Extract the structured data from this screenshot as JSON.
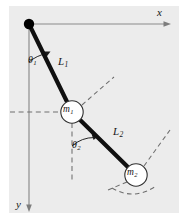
{
  "figure": {
    "kind": "double-pendulum-schematic",
    "background_color": "#ececec",
    "margin_color": "#ffffff",
    "axis_color": "#8a8a8a",
    "rod_color": "#101010",
    "dash_color": "#707070",
    "mass_fill": "#ffffff",
    "mass_stroke": "#303030",
    "pivot_color": "#000000"
  },
  "axes": {
    "x_label": "x",
    "y_label": "y",
    "x_origin": [
      29,
      24
    ],
    "x_end": [
      170,
      24
    ],
    "y_end": [
      29,
      212
    ]
  },
  "pivot": {
    "x": 29,
    "y": 24,
    "radius": 5.2
  },
  "rods": [
    {
      "name": "upper-rod",
      "label": "L",
      "subscript": "1",
      "from": [
        29,
        24
      ],
      "to": [
        72,
        112
      ],
      "width": 4.2
    },
    {
      "name": "lower-rod",
      "label": "L",
      "subscript": "2",
      "from": [
        72,
        112
      ],
      "to": [
        136,
        175
      ],
      "width": 4.2
    }
  ],
  "masses": [
    {
      "name": "mass-one",
      "label": "m",
      "subscript": "1",
      "cx": 72,
      "cy": 112,
      "r": 11.2
    },
    {
      "name": "mass-two",
      "label": "m",
      "subscript": "2",
      "cx": 136,
      "cy": 175,
      "r": 11.2
    }
  ],
  "angles": [
    {
      "name": "theta-one",
      "label": "θ",
      "subscript": "1",
      "vertex": [
        29,
        24
      ],
      "measured_from": "downward-vertical",
      "toward": "upper-rod"
    },
    {
      "name": "theta-two",
      "label": "θ",
      "subscript": "2",
      "vertex": [
        72,
        112
      ],
      "measured_from": "downward-vertical",
      "toward": "lower-rod"
    }
  ],
  "reference_lines": [
    {
      "name": "horizontal-dashed-through-m1",
      "orientation": "horizontal",
      "y": 112
    },
    {
      "name": "vertical-dashed-below-m1",
      "orientation": "vertical",
      "x": 72
    },
    {
      "name": "dashed-ray-upper-right-of-m1",
      "orientation": "diagonal"
    },
    {
      "name": "dashed-ray-upper-right-of-m2",
      "orientation": "diagonal"
    },
    {
      "name": "dashed-arc-below-m2",
      "orientation": "arc"
    }
  ]
}
